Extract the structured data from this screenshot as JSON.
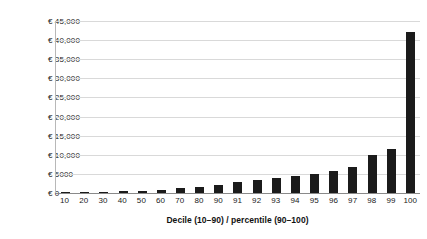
{
  "chart_data": {
    "type": "bar",
    "title": "",
    "subtitle": "",
    "xlabel": "Decile (10–90) / percentile (90–100)",
    "ylabel": "",
    "categories": [
      "10",
      "20",
      "30",
      "40",
      "50",
      "60",
      "70",
      "80",
      "90",
      "91",
      "92",
      "93",
      "94",
      "95",
      "96",
      "97",
      "98",
      "99",
      "100"
    ],
    "values": [
      100,
      200,
      300,
      400,
      600,
      900,
      1300,
      1700,
      2200,
      2900,
      3400,
      3900,
      4400,
      5000,
      5800,
      6800,
      10000,
      11500,
      42000
    ],
    "series": [
      {
        "name": "Amount",
        "values": [
          100,
          200,
          300,
          400,
          600,
          900,
          1300,
          1700,
          2200,
          2900,
          3400,
          3900,
          4400,
          5000,
          5800,
          6800,
          10000,
          11500,
          42000
        ]
      }
    ],
    "ylim": [
      0,
      45000
    ],
    "y_ticks": [
      0,
      5000,
      10000,
      15000,
      20000,
      25000,
      30000,
      35000,
      40000,
      45000
    ],
    "y_tick_labels": [
      "€ 0",
      "€ 5000",
      "€ 10,000",
      "€ 15,000",
      "€ 20,000",
      "€ 25,000",
      "€ 30,000",
      "€ 35,000",
      "€ 40,000",
      "€ 45,000"
    ],
    "grid": true,
    "legend": false,
    "legend_position": "none",
    "bar_color": "#1b1b1b",
    "gridline_color": "#d9d9d9",
    "axis_color": "#8a8a8a",
    "background_color": "#ffffff",
    "currency_symbol": "€"
  }
}
